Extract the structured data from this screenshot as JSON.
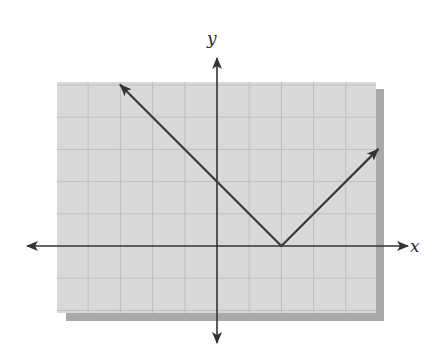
{
  "chart_data": {
    "type": "line",
    "title": "",
    "xlabel": "x",
    "ylabel": "y",
    "xlim": [
      -5,
      5
    ],
    "ylim": [
      -2,
      5
    ],
    "grid": true,
    "grid_step": 1,
    "tick_labels": false,
    "function": "y = |x - 2|",
    "series": [
      {
        "name": "absolute value graph",
        "x": [
          -3,
          2,
          5
        ],
        "y": [
          5,
          0,
          3
        ],
        "arrows_at_ends": true
      }
    ],
    "key_points": {
      "vertex": [
        2,
        0
      ],
      "y_intercept": [
        0,
        2
      ]
    },
    "legend": null
  },
  "labels": {
    "x_axis": "x",
    "y_axis": "y"
  },
  "colors": {
    "grid_background": "#d9d9d9",
    "grid_line": "#bfbfbf",
    "shadow": "#a9a9a9",
    "axis": "#333333",
    "curve": "#3a3a3a",
    "page": "#ffffff"
  }
}
